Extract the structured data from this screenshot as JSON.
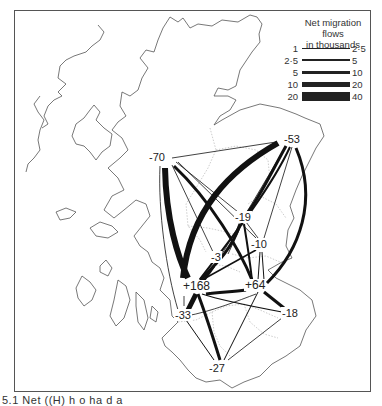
{
  "legend": {
    "title_line1": "Net migration flows",
    "title_line2": "in thousands",
    "rows": [
      {
        "from": "1",
        "to": "2·5",
        "width": 1
      },
      {
        "from": "2·5",
        "to": "5",
        "width": 2
      },
      {
        "from": "5",
        "to": "10",
        "width": 3
      },
      {
        "from": "10",
        "to": "20",
        "width": 5
      },
      {
        "from": "20",
        "to": "40",
        "width": 8
      }
    ]
  },
  "nodes": [
    {
      "id": "n70",
      "label": "-70",
      "x": 158,
      "y": 157
    },
    {
      "id": "n53",
      "label": "-53",
      "x": 282,
      "y": 139
    },
    {
      "id": "n19",
      "label": "-19",
      "x": 240,
      "y": 217
    },
    {
      "id": "n10",
      "label": "-10",
      "x": 257,
      "y": 243
    },
    {
      "id": "n3",
      "label": "-3",
      "x": 216,
      "y": 256
    },
    {
      "id": "n168",
      "label": "+168",
      "x": 193,
      "y": 285
    },
    {
      "id": "n64",
      "label": "+64",
      "x": 254,
      "y": 285
    },
    {
      "id": "n33",
      "label": "-33",
      "x": 181,
      "y": 315
    },
    {
      "id": "n18",
      "label": "-18",
      "x": 285,
      "y": 313
    },
    {
      "id": "n27",
      "label": "-27",
      "x": 217,
      "y": 367
    }
  ],
  "caption": "5.1  Net (Whole text truncated in view)",
  "caption_visible": "5.1  Net ((H) h  o  ha  d  a"
}
